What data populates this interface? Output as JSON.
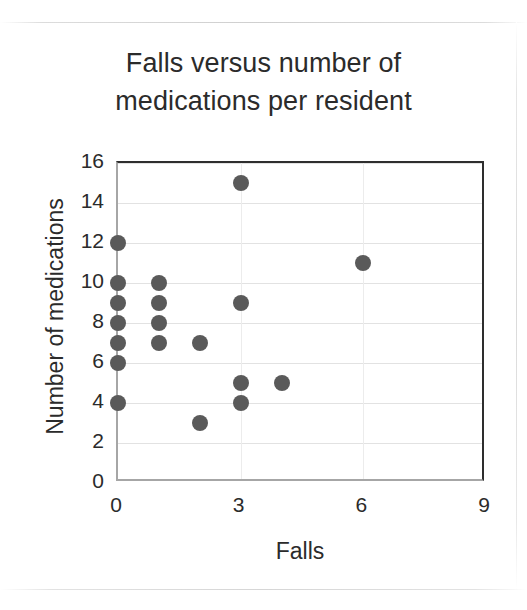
{
  "chart_data": {
    "type": "scatter",
    "title": "Falls versus number of medications per resident",
    "title_lines": [
      "Falls versus number of",
      "medications per resident"
    ],
    "xlabel": "Falls",
    "ylabel": "Number of medications",
    "xlim": [
      0,
      9
    ],
    "ylim": [
      0,
      16
    ],
    "xticks": [
      "0",
      "3",
      "6",
      "9"
    ],
    "xtick_values": [
      0,
      3,
      6,
      9
    ],
    "yticks": [
      "0",
      "2",
      "4",
      "6",
      "8",
      "10",
      "12",
      "14",
      "16"
    ],
    "ytick_values": [
      0,
      2,
      4,
      6,
      8,
      10,
      12,
      14,
      16
    ],
    "grid": "horizontal-and-vertical",
    "legend": "none",
    "marker": {
      "shape": "circle",
      "color": "#5a5a5a",
      "size_px": 16
    },
    "series": [
      {
        "name": "Residents",
        "points": [
          {
            "x": 0,
            "y": 12
          },
          {
            "x": 0,
            "y": 10
          },
          {
            "x": 0,
            "y": 9
          },
          {
            "x": 0,
            "y": 8
          },
          {
            "x": 0,
            "y": 7
          },
          {
            "x": 0,
            "y": 6
          },
          {
            "x": 0,
            "y": 4
          },
          {
            "x": 1,
            "y": 10
          },
          {
            "x": 1,
            "y": 9
          },
          {
            "x": 1,
            "y": 8
          },
          {
            "x": 1,
            "y": 7
          },
          {
            "x": 2,
            "y": 7
          },
          {
            "x": 2,
            "y": 3
          },
          {
            "x": 3,
            "y": 15
          },
          {
            "x": 3,
            "y": 9
          },
          {
            "x": 3,
            "y": 5
          },
          {
            "x": 3,
            "y": 4
          },
          {
            "x": 4,
            "y": 5
          },
          {
            "x": 6,
            "y": 11
          }
        ]
      }
    ]
  },
  "colors": {
    "marker": "#5a5a5a",
    "text": "#2b2b2b",
    "gridline": "#e2e2e2",
    "axis_dark": "#2e2e2e",
    "axis_light": "#a6a6a6",
    "background": "#ffffff"
  }
}
